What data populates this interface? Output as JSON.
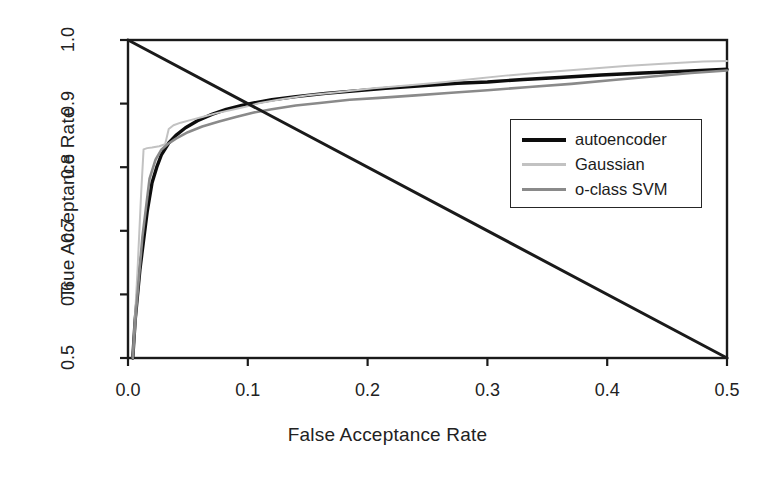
{
  "chart_data": {
    "type": "line",
    "title": "",
    "xlabel": "False Acceptance Rate",
    "ylabel": "True Acceptance Rate",
    "xlim": [
      0.0,
      0.5
    ],
    "ylim": [
      0.5,
      1.0
    ],
    "grid": false,
    "legend_position": "center-right",
    "xticks": [
      "0.0",
      "0.1",
      "0.2",
      "0.3",
      "0.4",
      "0.5"
    ],
    "xtick_values": [
      0.0,
      0.1,
      0.2,
      0.3,
      0.4,
      0.5
    ],
    "yticks": [
      "0.5",
      "0.6",
      "0.7",
      "0.8",
      "0.9",
      "1.0"
    ],
    "ytick_values": [
      0.5,
      0.6,
      0.7,
      0.8,
      0.9,
      1.0
    ],
    "series": [
      {
        "name": "autoencoder",
        "color": "#0d0d0d",
        "width": 3.4,
        "x": [
          0.004,
          0.006,
          0.01,
          0.016,
          0.02,
          0.024,
          0.028,
          0.034,
          0.04,
          0.048,
          0.058,
          0.07,
          0.082,
          0.095,
          0.105,
          0.12,
          0.14,
          0.165,
          0.19,
          0.215,
          0.245,
          0.275,
          0.3,
          0.33,
          0.36,
          0.395,
          0.43,
          0.465,
          0.5
        ],
        "y": [
          0.5,
          0.56,
          0.64,
          0.73,
          0.775,
          0.8,
          0.82,
          0.838,
          0.85,
          0.862,
          0.873,
          0.883,
          0.891,
          0.897,
          0.901,
          0.906,
          0.911,
          0.916,
          0.92,
          0.924,
          0.928,
          0.932,
          0.934,
          0.938,
          0.941,
          0.945,
          0.948,
          0.951,
          0.954
        ]
      },
      {
        "name": "Gaussian",
        "color": "#c2c2c2",
        "width": 2.0,
        "x": [
          0.004,
          0.008,
          0.011,
          0.013,
          0.016,
          0.02,
          0.026,
          0.031,
          0.034,
          0.038,
          0.044,
          0.052,
          0.062,
          0.074,
          0.086,
          0.098,
          0.11,
          0.128,
          0.15,
          0.175,
          0.205,
          0.235,
          0.265,
          0.29,
          0.315,
          0.345,
          0.38,
          0.415,
          0.45,
          0.48,
          0.5
        ],
        "y": [
          0.5,
          0.64,
          0.76,
          0.828,
          0.83,
          0.831,
          0.833,
          0.836,
          0.86,
          0.866,
          0.87,
          0.874,
          0.879,
          0.885,
          0.89,
          0.895,
          0.901,
          0.907,
          0.913,
          0.918,
          0.924,
          0.929,
          0.934,
          0.939,
          0.944,
          0.949,
          0.954,
          0.959,
          0.963,
          0.966,
          0.967
        ]
      },
      {
        "name": "o-class SVM",
        "color": "#8a8a8a",
        "width": 2.6,
        "x": [
          0.004,
          0.007,
          0.012,
          0.018,
          0.023,
          0.028,
          0.033,
          0.04,
          0.05,
          0.062,
          0.076,
          0.09,
          0.105,
          0.12,
          0.14,
          0.16,
          0.185,
          0.21,
          0.24,
          0.27,
          0.3,
          0.335,
          0.37,
          0.405,
          0.44,
          0.47,
          0.5
        ],
        "y": [
          0.5,
          0.58,
          0.69,
          0.782,
          0.812,
          0.828,
          0.836,
          0.845,
          0.855,
          0.864,
          0.872,
          0.879,
          0.886,
          0.891,
          0.897,
          0.901,
          0.906,
          0.909,
          0.913,
          0.917,
          0.921,
          0.926,
          0.931,
          0.937,
          0.943,
          0.948,
          0.952
        ]
      },
      {
        "name": "reference-diagonal",
        "color": "#1a1a1a",
        "width": 3.0,
        "x": [
          0.0,
          0.5
        ],
        "y": [
          1.0,
          0.5
        ]
      }
    ]
  },
  "legend": {
    "entries": [
      {
        "label": "autoencoder"
      },
      {
        "label": "Gaussian"
      },
      {
        "label": "o-class SVM"
      }
    ]
  },
  "colors": {
    "axis": "#1a1a1a",
    "background": "#ffffff",
    "autoencoder": "#0d0d0d",
    "gaussian": "#c2c2c2",
    "oclass_svm": "#8a8a8a"
  }
}
